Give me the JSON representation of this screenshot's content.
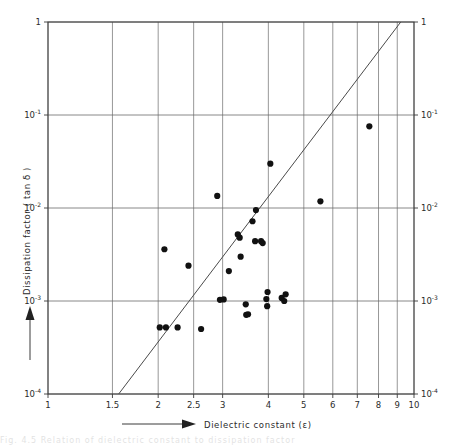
{
  "figure": {
    "kind": "scientific-scatter-plot",
    "background_color": "#ffffff",
    "line_color": "#4a4a4a",
    "grid_color": "#6b6b6b",
    "point_color": "#111111",
    "bottom_caption_partial": "Fig. 4.5  Relation of dielectric constant to dissipation factor"
  },
  "chart_data": {
    "type": "scatter",
    "title": "",
    "xlabel": "Dielectric constant (ε)",
    "ylabel": "Dissipation factor ( tan δ )",
    "xscale": "log",
    "yscale": "log",
    "xlim": [
      1,
      10
    ],
    "ylim": [
      0.0001,
      1
    ],
    "grid": true,
    "legend": false,
    "x_tick_labels": [
      "1",
      "1.5",
      "2",
      "2.5",
      "3",
      "4",
      "5",
      "6",
      "7",
      "8",
      "9",
      "10"
    ],
    "x_tick_values": [
      1,
      1.5,
      2,
      2.5,
      3,
      4,
      5,
      6,
      7,
      8,
      9,
      10
    ],
    "y_tick_labels": [
      "1",
      "10⁻¹",
      "10⁻²",
      "10⁻³",
      "10⁻⁴"
    ],
    "y_tick_values": [
      1,
      0.1,
      0.01,
      0.001,
      0.0001
    ],
    "y_tick_mantissa": [
      "1",
      "10",
      "10",
      "10",
      "10"
    ],
    "y_tick_exponent": [
      "",
      "-1",
      "-2",
      "-3",
      "-4"
    ],
    "left_axis_labels_shown": true,
    "right_axis_labels_shown": true,
    "trendline": {
      "label": "",
      "x_start": 1.56,
      "y_start": 0.0001,
      "x_end": 9.2,
      "y_end": 1.0
    },
    "points": [
      {
        "x": 2.02,
        "y": 0.00052
      },
      {
        "x": 2.1,
        "y": 0.00052
      },
      {
        "x": 2.26,
        "y": 0.00052
      },
      {
        "x": 2.62,
        "y": 0.0005
      },
      {
        "x": 2.08,
        "y": 0.0036
      },
      {
        "x": 2.42,
        "y": 0.0024
      },
      {
        "x": 2.9,
        "y": 0.0135
      },
      {
        "x": 2.95,
        "y": 0.00103
      },
      {
        "x": 3.02,
        "y": 0.00104
      },
      {
        "x": 3.12,
        "y": 0.0021
      },
      {
        "x": 3.3,
        "y": 0.0052
      },
      {
        "x": 3.34,
        "y": 0.0048
      },
      {
        "x": 3.36,
        "y": 0.003
      },
      {
        "x": 3.47,
        "y": 0.00092
      },
      {
        "x": 3.48,
        "y": 0.00071
      },
      {
        "x": 3.52,
        "y": 0.00072
      },
      {
        "x": 3.62,
        "y": 0.0072
      },
      {
        "x": 3.7,
        "y": 0.0095
      },
      {
        "x": 3.68,
        "y": 0.0044
      },
      {
        "x": 3.82,
        "y": 0.0044
      },
      {
        "x": 3.86,
        "y": 0.0042
      },
      {
        "x": 3.95,
        "y": 0.00105
      },
      {
        "x": 3.97,
        "y": 0.00088
      },
      {
        "x": 3.98,
        "y": 0.00125
      },
      {
        "x": 4.05,
        "y": 0.03
      },
      {
        "x": 4.35,
        "y": 0.00108
      },
      {
        "x": 4.42,
        "y": 0.001
      },
      {
        "x": 4.46,
        "y": 0.00118
      },
      {
        "x": 5.55,
        "y": 0.0118
      },
      {
        "x": 7.55,
        "y": 0.0755
      }
    ]
  },
  "axis_arrows": {
    "x_arrow_label": "Dielectric constant (ε)",
    "y_arrow_label": "Dissipation factor ( tan δ )"
  }
}
